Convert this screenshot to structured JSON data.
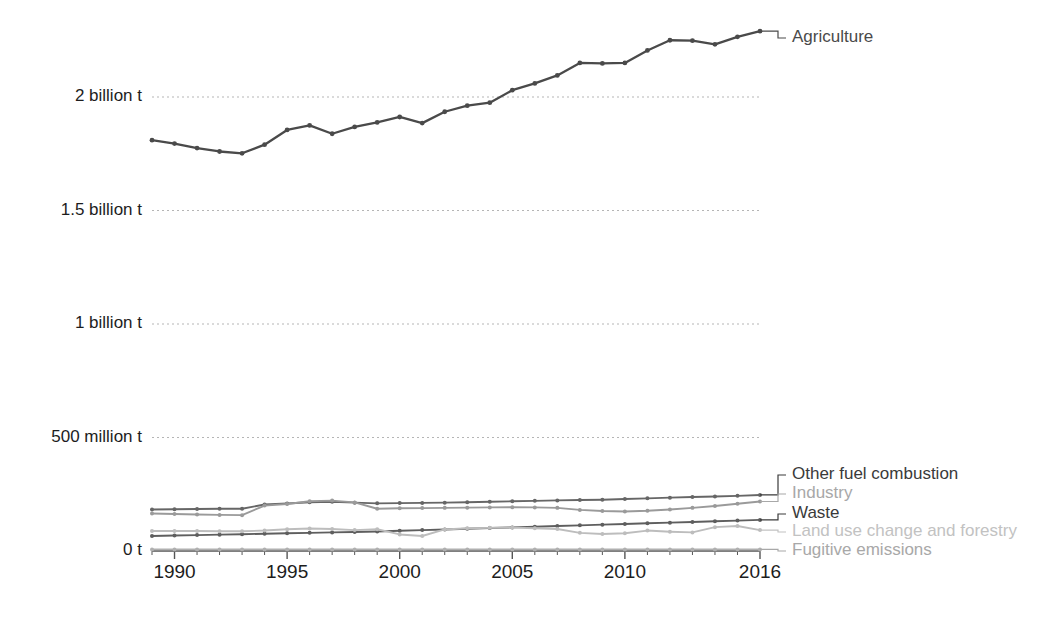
{
  "chart_data": {
    "type": "line",
    "title": "",
    "subtitle": "",
    "xlabel": "",
    "ylabel": "",
    "grid": true,
    "legend_position": "right-inline-labels",
    "x": [
      1989,
      1990,
      1991,
      1992,
      1993,
      1994,
      1995,
      1996,
      1997,
      1998,
      1999,
      2000,
      2001,
      2002,
      2003,
      2004,
      2005,
      2006,
      2007,
      2008,
      2009,
      2010,
      2011,
      2012,
      2013,
      2014,
      2015,
      2016
    ],
    "x_ticks": [
      "1990",
      "1995",
      "2000",
      "2005",
      "2010",
      "2016"
    ],
    "x_tick_values": [
      1990,
      1995,
      2000,
      2005,
      2010,
      2016
    ],
    "y_ticks": [
      "0 t",
      "500 million t",
      "1 billion t",
      "1.5 billion t",
      "2 billion t"
    ],
    "y_tick_values": [
      0,
      500000000,
      1000000000,
      1500000000,
      2000000000
    ],
    "ylim": [
      0,
      2300000000
    ],
    "xlim": [
      1989,
      2016
    ],
    "units": "tonnes",
    "series": [
      {
        "name": "Agriculture",
        "color": "#4a4a4a",
        "label_color": "#4a4a4a",
        "values": [
          1810000000,
          1795000000,
          1775000000,
          1760000000,
          1752000000,
          1790000000,
          1855000000,
          1875000000,
          1838000000,
          1868000000,
          1888000000,
          1912000000,
          1885000000,
          1935000000,
          1962000000,
          1975000000,
          2030000000,
          2060000000,
          2095000000,
          2150000000,
          2148000000,
          2150000000,
          2205000000,
          2250000000,
          2248000000,
          2232000000,
          2265000000,
          2290000000
        ]
      },
      {
        "name": "Other fuel combustion",
        "color": "#666666",
        "label_color": "#3a3a3a",
        "values": [
          183000000,
          184000000,
          185000000,
          186000000,
          186000000,
          205000000,
          209000000,
          215000000,
          217000000,
          213000000,
          210000000,
          211000000,
          212000000,
          213000000,
          215000000,
          217000000,
          219000000,
          221000000,
          223000000,
          225000000,
          226000000,
          229000000,
          232000000,
          235000000,
          238000000,
          240000000,
          243000000,
          247000000
        ]
      },
      {
        "name": "Industry",
        "color": "#9a9a9a",
        "label_color": "#a8a8a8",
        "values": [
          165000000,
          163000000,
          161000000,
          159000000,
          158000000,
          200000000,
          207000000,
          219000000,
          222000000,
          214000000,
          186000000,
          188000000,
          189000000,
          190000000,
          191000000,
          192000000,
          193000000,
          192000000,
          190000000,
          181000000,
          176000000,
          174000000,
          177000000,
          183000000,
          190000000,
          198000000,
          208000000,
          218000000
        ]
      },
      {
        "name": "Waste",
        "color": "#5e5e5e",
        "label_color": "#3a3a3a",
        "values": [
          66000000,
          68000000,
          70000000,
          72000000,
          74000000,
          76000000,
          78000000,
          80000000,
          82000000,
          84000000,
          86000000,
          89000000,
          92000000,
          95000000,
          98000000,
          101000000,
          104000000,
          107000000,
          110000000,
          113000000,
          116000000,
          119000000,
          122000000,
          125000000,
          128000000,
          131000000,
          134000000,
          137000000
        ]
      },
      {
        "name": "Land use change and forestry",
        "color": "#bdbdbd",
        "label_color": "#c2c2c2",
        "values": [
          88000000,
          88000000,
          88000000,
          87000000,
          87000000,
          90000000,
          96000000,
          99000000,
          97000000,
          92000000,
          96000000,
          73000000,
          66000000,
          95000000,
          100000000,
          102000000,
          103000000,
          100000000,
          97000000,
          80000000,
          75000000,
          78000000,
          90000000,
          85000000,
          82000000,
          105000000,
          110000000,
          92000000
        ]
      },
      {
        "name": "Fugitive emissions",
        "color": "#b0b0b0",
        "label_color": "#a8a8a8",
        "values": [
          7000000,
          7000000,
          7000000,
          7000000,
          7000000,
          7000000,
          7000000,
          7000000,
          7000000,
          7000000,
          7000000,
          7000000,
          7000000,
          7000000,
          7000000,
          7000000,
          7000000,
          7000000,
          7000000,
          7000000,
          7000000,
          7000000,
          7000000,
          7000000,
          7000000,
          7000000,
          7000000,
          7000000
        ]
      }
    ]
  },
  "colors": {
    "gridline": "#b5b5b5",
    "axis": "#555555",
    "background": "#ffffff",
    "text": "#1d1d1d"
  }
}
